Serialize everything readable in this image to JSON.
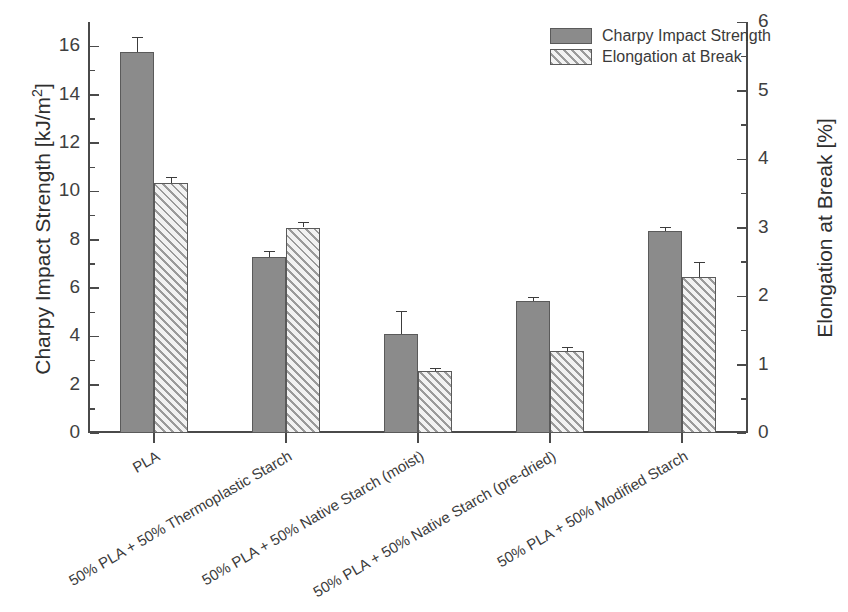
{
  "chart_data": {
    "type": "bar",
    "title": "",
    "categories": [
      "PLA",
      "50% PLA + 50% Thermoplastic Starch",
      "50% PLA + 50% Native Starch (moist)",
      "50% PLA + 50% Native Starch (pre-dried)",
      "50% PLA + 50% Modified Starch"
    ],
    "series": [
      {
        "name": "Charpy Impact Strength",
        "axis": "left",
        "unit": "kJ/m2",
        "values": [
          15.75,
          7.3,
          4.1,
          5.45,
          8.35
        ],
        "errors": [
          0.65,
          0.22,
          0.95,
          0.18,
          0.18
        ],
        "fill": "solid",
        "color": "#8b8b8b"
      },
      {
        "name": "Elongation at Break",
        "axis": "right",
        "unit": "%",
        "values": [
          3.65,
          3.0,
          0.9,
          1.2,
          2.28
        ],
        "errors": [
          0.08,
          0.08,
          0.05,
          0.05,
          0.22
        ],
        "fill": "hatch",
        "color": "#9a9a9a"
      }
    ],
    "xlabel": "",
    "ylabel": "Charpy Impact Strength [kJ/m2]",
    "y2label": "Elongation at Break [%]",
    "ylim": [
      0,
      17
    ],
    "y2lim": [
      0,
      6
    ],
    "yticks": [
      0,
      2,
      4,
      6,
      8,
      10,
      12,
      14,
      16
    ],
    "y2ticks": [
      0,
      1,
      2,
      3,
      4,
      5,
      6
    ],
    "y_minor_step": 1,
    "y2_minor_step": 0.5,
    "grid": false,
    "legend_position": "top-right"
  },
  "axes": {
    "left": {
      "title_main": "Charpy Impact Strength [kJ/m",
      "title_sup": "2",
      "title_tail": "]",
      "ticklabels": [
        "16",
        "14",
        "12",
        "10",
        "8",
        "6",
        "4",
        "2",
        "0"
      ]
    },
    "right": {
      "title": "Elongation at Break [%]",
      "ticklabels": [
        "6",
        "5",
        "4",
        "3",
        "2",
        "1",
        "0"
      ]
    },
    "x": {
      "ticklabels": [
        "PLA",
        "50% PLA + 50% Thermoplastic Starch",
        "50% PLA + 50% Native Starch (moist)",
        "50% PLA + 50% Native Starch (pre-dried)",
        "50% PLA + 50% Modified Starch"
      ]
    }
  },
  "legend": {
    "entries": [
      {
        "label": "Charpy Impact Strength",
        "swatch": "solid"
      },
      {
        "label": "Elongation at Break",
        "swatch": "hatch"
      }
    ]
  },
  "caption": {
    "text": ""
  }
}
